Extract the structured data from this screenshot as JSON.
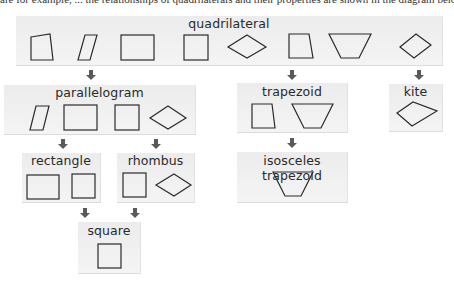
{
  "header_fragment": "are for example, ... the relationships of quadrilaterals and their properties are shown in the diagram below.",
  "colors": {
    "box_bg": "#efefef",
    "shape_stroke": "#2b2b2b",
    "arrow": "#5a5a5a"
  },
  "nodes": {
    "quadrilateral": {
      "label": "quadrilateral",
      "shapes": [
        "irregular quadrilateral",
        "parallelogram",
        "rectangle",
        "square",
        "rhombus",
        "trapezoid (right)",
        "isosceles trapezoid",
        "kite"
      ]
    },
    "parallelogram": {
      "label": "parallelogram",
      "shapes": [
        "parallelogram",
        "rectangle",
        "square",
        "rhombus"
      ]
    },
    "trapezoid": {
      "label": "trapezoid",
      "shapes": [
        "right trapezoid",
        "isosceles trapezoid"
      ]
    },
    "kite": {
      "label": "kite",
      "shapes": [
        "kite"
      ]
    },
    "rectangle": {
      "label": "rectangle",
      "shapes": [
        "rectangle",
        "square"
      ]
    },
    "rhombus": {
      "label": "rhombus",
      "shapes": [
        "square",
        "rhombus"
      ]
    },
    "isosceles_trapezoid": {
      "label": "isosceles trapezoid",
      "shapes": [
        "isosceles trapezoid"
      ]
    },
    "square": {
      "label": "square",
      "shapes": [
        "square"
      ]
    }
  },
  "edges": [
    {
      "from": "quadrilateral",
      "to": "parallelogram"
    },
    {
      "from": "quadrilateral",
      "to": "trapezoid"
    },
    {
      "from": "quadrilateral",
      "to": "kite"
    },
    {
      "from": "parallelogram",
      "to": "rectangle"
    },
    {
      "from": "parallelogram",
      "to": "rhombus"
    },
    {
      "from": "trapezoid",
      "to": "isosceles_trapezoid"
    },
    {
      "from": "rectangle",
      "to": "square"
    },
    {
      "from": "rhombus",
      "to": "square"
    }
  ]
}
